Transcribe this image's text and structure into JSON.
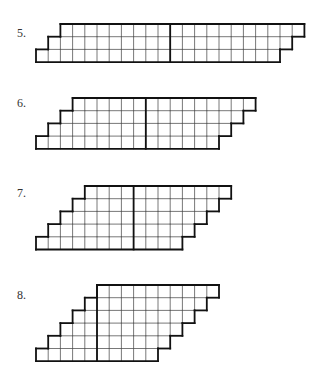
{
  "problems": [
    {
      "label": "5.",
      "rows": 3,
      "row_left": [
        11,
        10,
        9
      ],
      "row_right": [
        9,
        10,
        11
      ],
      "top_y": 24,
      "label_x": 17,
      "label_y": 26
    },
    {
      "label": "6.",
      "rows": 4,
      "row_left": [
        9,
        8,
        7,
        6
      ],
      "row_right": [
        6,
        7,
        8,
        9
      ],
      "top_y": 98,
      "label_x": 17,
      "label_y": 96
    },
    {
      "label": "7.",
      "rows": 5,
      "row_left": [
        8,
        7,
        6,
        5,
        4
      ],
      "row_right": [
        4,
        5,
        6,
        7,
        8
      ],
      "top_y": 186,
      "label_x": 17,
      "label_y": 186
    },
    {
      "label": "8.",
      "rows": 6,
      "row_left": [
        5,
        4,
        3,
        2,
        1,
        0
      ],
      "row_right": [
        5,
        6,
        7,
        8,
        9,
        10
      ],
      "top_y": 285,
      "label_x": 17,
      "label_y": 288
    }
  ],
  "grid": {
    "cell_w": 12.2,
    "cell_h": 12.7,
    "left_x": 36,
    "line_color": "#555555",
    "outline_color": "#111111"
  },
  "note": "row_left / row_right listed bottom row first: number of unit squares left / right of the bold divider"
}
